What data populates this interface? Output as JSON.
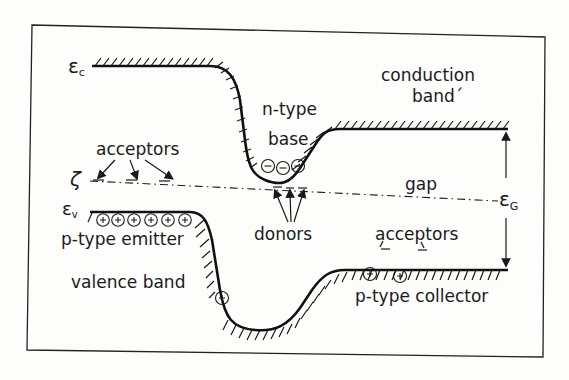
{
  "diagram": {
    "colors": {
      "ink": "#1a1a1a",
      "paper": "#fdfdfb"
    },
    "symbols": {
      "conduction_edge": "ε",
      "conduction_edge_sub": "c",
      "valence_edge": "ε",
      "valence_edge_sub": "v",
      "fermi_level": "ζ",
      "gap_energy": "ε",
      "gap_energy_sub": "G"
    },
    "labels": {
      "conduction_band_line1": "conduction",
      "conduction_band_line2": "band´",
      "n_type": "n-type",
      "base": "base",
      "acceptors_left": "acceptors",
      "gap": "gap",
      "donors": "donors",
      "p_type_emitter": "p-type emitter",
      "acceptors_right": "acceptors",
      "valence_band": "valence band",
      "p_type_collector": "p-type collector"
    },
    "carriers": {
      "electron_symbol": "−",
      "hole_symbol": "+",
      "electrons_in_base": 3,
      "holes_in_emitter": 6,
      "holes_in_valence_slope": 1,
      "holes_in_collector": 2
    },
    "regions": [
      "p-type emitter",
      "n-type base",
      "p-type collector"
    ]
  }
}
